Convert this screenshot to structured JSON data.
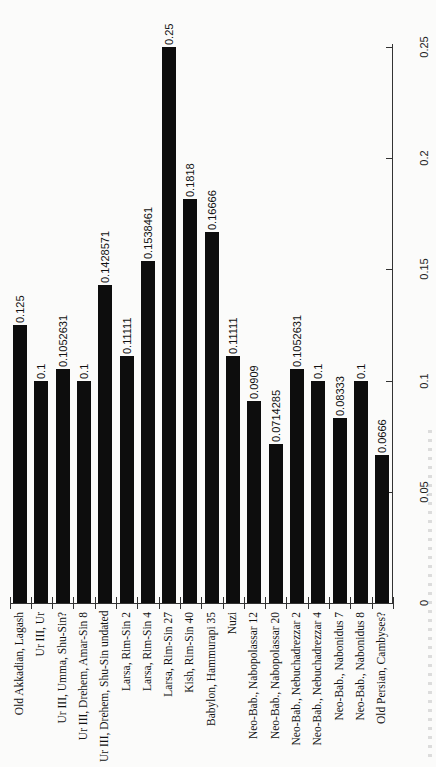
{
  "chart_data": {
    "type": "bar",
    "orientation": "vertical bars, page rotated 90° (read with value axis on right)",
    "title": "",
    "xlabel": "",
    "ylabel": "",
    "categories": [
      "Old Akkadian, Lagash",
      "Ur III, Ur",
      "Ur III, Umma, Shu-Sin?",
      "Ur III, Drehem, Amar-Sin 8",
      "Ur III, Drehem, Shu-Sin undated",
      "Larsa, Rim-Sin 2",
      "Larsa, Rim-Sin 4",
      "Larsa, Rim-Sin 27",
      "Kish, Rim-Sin 40",
      "Babylon, Hammurapi 35",
      "Nuzi",
      "Neo-Bab., Nabopolassar 12",
      "Neo-Bab., Nabopolassar 20",
      "Neo-Bab., Nebuchadrezzar 2",
      "Neo-Bab., Nebuchadrezzar 4",
      "Neo-Bab., Nabonidus 7",
      "Neo-Bab., Nabonidus 8",
      "Old Persian, Cambyses?"
    ],
    "values": [
      0.125,
      0.1,
      0.1052631,
      0.1,
      0.1428571,
      0.11111,
      0.1538461,
      0.25,
      0.1818,
      0.16666,
      0.11111,
      0.0909,
      0.0714285,
      0.1052631,
      0.1,
      0.08333,
      0.1,
      0.0666
    ],
    "value_labels": [
      "0.125",
      "0.1",
      "0.1052631",
      "0.1",
      "0.1428571",
      "0.11111",
      "0.1538461",
      "0.25",
      "0.1818",
      "0.16666",
      "0.11111",
      "0.0909",
      "0.0714285",
      "0.1052631",
      "0.1",
      "0.08333",
      "0.1",
      "0.0666"
    ],
    "ylim": [
      0,
      0.25
    ],
    "yticks": [
      0,
      0.05,
      0.1,
      0.15,
      0.2,
      0.25
    ],
    "ytick_labels": [
      "0",
      "0.05",
      "0.1",
      "0.15",
      "0.2",
      "0.25"
    ],
    "grid": false,
    "legend": null,
    "bar_color": "#0d0d0d"
  }
}
